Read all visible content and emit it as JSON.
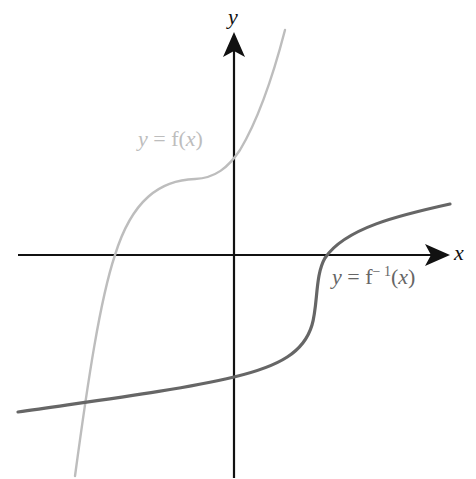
{
  "diagram": {
    "axes": {
      "x_label": "x",
      "y_label": "y"
    },
    "curves": [
      {
        "name": "f",
        "label_prefix": "y = ",
        "label_func": "f(",
        "label_var": "x",
        "label_close": ")",
        "color": "#bdbdbd"
      },
      {
        "name": "f_inverse",
        "label_prefix": "y = ",
        "label_func": "f",
        "label_sup": "− 1",
        "label_open": "(",
        "label_var": "x",
        "label_close": ")",
        "color": "#666666"
      }
    ],
    "colors": {
      "axis": "#111111",
      "f": "#bdbdbd",
      "f_inverse": "#666666",
      "background": "#ffffff"
    }
  }
}
